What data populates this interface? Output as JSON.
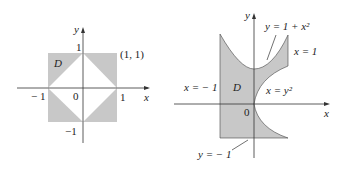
{
  "left_figure": {
    "axis_x": "x",
    "axis_y": "y",
    "region": "D",
    "point": "(1, 1)",
    "ticks": {
      "x_pos": "1",
      "x_neg": "− 1",
      "y_pos": "1",
      "y_neg": "−1",
      "origin": "0"
    }
  },
  "right_figure": {
    "axis_x": "x",
    "axis_y": "y",
    "region": "D",
    "origin": "0",
    "curve_top": "y = 1 + x²",
    "line_right": "x = 1",
    "line_left": "x = − 1",
    "curve_right": "x = y²",
    "line_bottom": "y = − 1"
  },
  "colors": {
    "fill": "#c8c8c8",
    "line": "#333333"
  }
}
